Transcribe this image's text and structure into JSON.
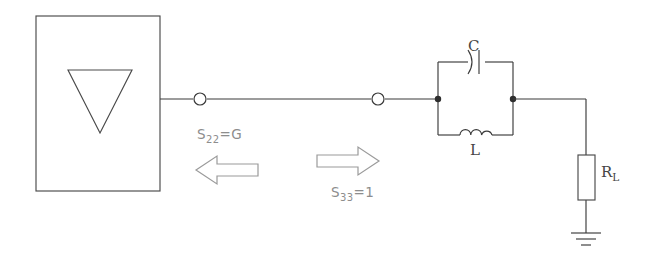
{
  "diagram": {
    "background_color": "#ffffff",
    "line_color": "#3a3a3a",
    "arrow_color": "#9a9a9a",
    "label_color": "#4a4a4a"
  },
  "blocks": {
    "active_device": {
      "name": "amplifier-block",
      "symbol": "inverting-triangle"
    }
  },
  "components": {
    "capacitor": {
      "label": "C",
      "symbol": "capacitor-curved"
    },
    "inductor": {
      "label": "L",
      "symbol": "inductor-coil"
    },
    "load_resistor": {
      "label": "R",
      "sub": "L",
      "symbol": "resistor-box"
    },
    "ground": {
      "symbol": "earth-ground"
    }
  },
  "annotations": [
    {
      "id": "s22",
      "text": "S",
      "sub": "22",
      "value": "=G",
      "direction": "left"
    },
    {
      "id": "s33",
      "text": "S",
      "sub": "33",
      "value": "=1",
      "direction": "right"
    }
  ],
  "nodes": {
    "port_open_1": "connector-node",
    "port_open_2": "connector-node",
    "tank_left": "junction-dot",
    "tank_right": "junction-dot"
  }
}
